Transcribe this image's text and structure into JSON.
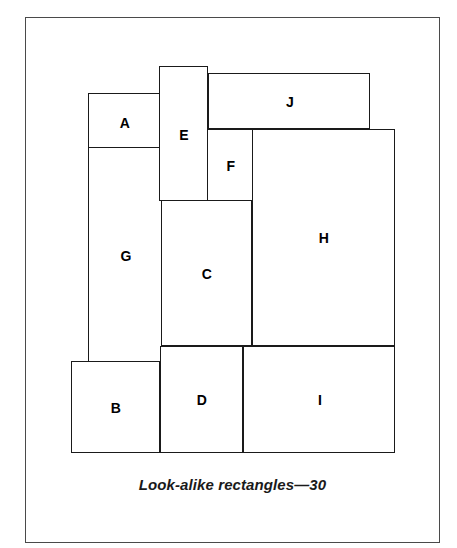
{
  "figure": {
    "caption": "Look-alike rectangles—30",
    "frame": {
      "x": 25,
      "y": 17,
      "width": 415,
      "height": 526,
      "border_color": "#4a4a4a"
    },
    "line_color": "#1a1a1a",
    "fill_color": "#ffffff",
    "background": "#ffffff"
  },
  "rectangles": [
    {
      "label": "A",
      "x": 88,
      "y": 93,
      "width": 74,
      "height": 55,
      "label_x": 124,
      "label_y": 122,
      "z": 3
    },
    {
      "label": "B",
      "x": 71,
      "y": 361,
      "width": 89,
      "height": 92,
      "label_x": 115,
      "label_y": 407,
      "z": 4
    },
    {
      "label": "C",
      "x": 161,
      "y": 200,
      "width": 91,
      "height": 146,
      "label_x": 206,
      "label_y": 273,
      "z": 3
    },
    {
      "label": "D",
      "x": 160,
      "y": 346,
      "width": 83,
      "height": 107,
      "label_x": 201,
      "label_y": 399,
      "z": 3
    },
    {
      "label": "E",
      "x": 159,
      "y": 66,
      "width": 49,
      "height": 135,
      "label_x": 183,
      "label_y": 134,
      "z": 5
    },
    {
      "label": "F",
      "x": 206,
      "y": 129,
      "width": 47,
      "height": 72,
      "label_x": 230,
      "label_y": 165,
      "z": 4
    },
    {
      "label": "G",
      "x": 88,
      "y": 147,
      "width": 74,
      "height": 216,
      "label_x": 125,
      "label_y": 255,
      "z": 2
    },
    {
      "label": "H",
      "x": 252,
      "y": 129,
      "width": 143,
      "height": 217,
      "label_x": 323,
      "label_y": 237,
      "z": 2
    },
    {
      "label": "I",
      "x": 243,
      "y": 346,
      "width": 152,
      "height": 107,
      "label_x": 319,
      "label_y": 399,
      "z": 2
    },
    {
      "label": "J",
      "x": 208,
      "y": 73,
      "width": 162,
      "height": 56,
      "label_x": 289,
      "label_y": 101,
      "z": 1
    }
  ]
}
